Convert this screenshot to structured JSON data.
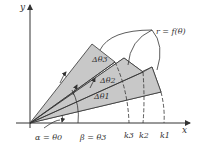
{
  "diagram": {
    "axes": {
      "x_label": "x",
      "y_label": "y"
    },
    "curve_label": "r = f(θ)",
    "sector_labels": [
      "Δθ3",
      "Δθ2",
      "Δθ1"
    ],
    "angle_labels": {
      "alpha": "α = θ0",
      "beta": "β = θ3"
    },
    "radius_ticks": [
      "k3",
      "k2",
      "k1"
    ],
    "colors": {
      "sector_fill": "#c8c8c8",
      "stroke": "#333333",
      "background": "#ffffff"
    }
  }
}
